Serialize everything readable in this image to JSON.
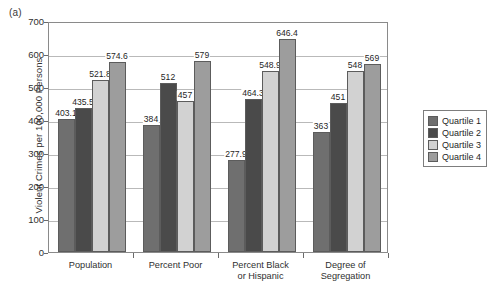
{
  "panel_letter": "(a)",
  "chart_data": {
    "type": "bar",
    "title": "",
    "xlabel": "",
    "ylabel": "Violent Crimes per 100,000 Persons",
    "ylim": [
      0,
      700
    ],
    "yticks": [
      0,
      100,
      200,
      300,
      400,
      500,
      600,
      700
    ],
    "ytick_labels": [
      "0",
      "100",
      "200",
      "300",
      "400",
      "500",
      "600",
      "700"
    ],
    "grid": true,
    "grid_axis": "y",
    "legend_position": "right",
    "categories": [
      "Population",
      "Percent Poor",
      "Percent Black or Hispanic",
      "Degree of Segregation"
    ],
    "category_lines": [
      [
        "Population"
      ],
      [
        "Percent Poor"
      ],
      [
        "Percent Black",
        "or Hispanic"
      ],
      [
        "Degree of",
        "Segregation"
      ]
    ],
    "series": [
      {
        "name": "Quartile 1",
        "color": "#6f6f6f",
        "values": [
          403.1,
          384,
          277.9,
          363
        ],
        "labels": [
          "403.1",
          "384",
          "277.9",
          "363"
        ]
      },
      {
        "name": "Quartile 2",
        "color": "#4a4a4a",
        "values": [
          435.5,
          512,
          464.3,
          451
        ],
        "labels": [
          "435.5",
          "512",
          "464.3",
          "451"
        ]
      },
      {
        "name": "Quartile 3",
        "color": "#d2d2d2",
        "values": [
          521.8,
          457,
          548.9,
          548
        ],
        "labels": [
          "521.8",
          "457",
          "548.9",
          "548"
        ]
      },
      {
        "name": "Quartile 4",
        "color": "#9d9d9d",
        "values": [
          574.6,
          579,
          646.4,
          569
        ],
        "labels": [
          "574.6",
          "579",
          "646.4",
          "569"
        ]
      }
    ]
  },
  "legend": {
    "items": [
      {
        "label": "Quartile 1",
        "color": "#6f6f6f"
      },
      {
        "label": "Quartile 2",
        "color": "#4a4a4a"
      },
      {
        "label": "Quartile 3",
        "color": "#d2d2d2"
      },
      {
        "label": "Quartile 4",
        "color": "#9d9d9d"
      }
    ]
  }
}
